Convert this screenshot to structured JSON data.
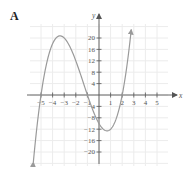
{
  "figure": {
    "panel_label": "A"
  },
  "chart_data": {
    "type": "line",
    "title": "",
    "panel_label": "A",
    "function": "f(x) = (x+5)(x+1)(x-2) = x^3 + 4x^2 - 7x - 10",
    "xlabel": "x",
    "ylabel": "y",
    "xlim": [
      -6,
      6.5
    ],
    "ylim": [
      -25,
      26
    ],
    "grid": true,
    "x_ticks": [
      -5,
      -4,
      -3,
      -2,
      -1,
      1,
      2,
      3,
      4,
      5
    ],
    "x_tick_labels": [
      "−5",
      "−4",
      "−3",
      "−2",
      "−1",
      "1",
      "2",
      "3",
      "4",
      "5"
    ],
    "y_ticks": [
      20,
      16,
      12,
      8,
      4,
      -4,
      -8,
      -12,
      -16,
      -20
    ],
    "y_tick_labels": [
      "20",
      "16",
      "12",
      "8",
      "4",
      "−4",
      "−8",
      "−12",
      "−16",
      "−20"
    ],
    "roots": [
      -5,
      -1,
      2
    ],
    "local_max": [
      -3.36,
      20.8
    ],
    "local_min": [
      0.69,
      -12.6
    ],
    "y_intercept": -10,
    "x_domain_drawn": [
      -5.66,
      2.78
    ],
    "arrows_at_ends": true,
    "series": [
      {
        "name": "f(x)",
        "color": "#9a9a9a",
        "x": [
          -5.66,
          -5.5,
          -5,
          -4.5,
          -4,
          -3.5,
          -3.36,
          -3,
          -2.5,
          -2,
          -1.5,
          -1,
          -0.5,
          0,
          0.5,
          0.69,
          1,
          1.5,
          2,
          2.5,
          2.78
        ],
        "y": [
          -23.4,
          -17.4,
          0,
          12.6,
          18,
          20.6,
          20.8,
          20,
          16.9,
          12,
          5.6,
          0,
          -5.6,
          -10,
          -12.4,
          -12.6,
          -12,
          -7.6,
          0,
          11.9,
          23.0
        ]
      }
    ]
  }
}
